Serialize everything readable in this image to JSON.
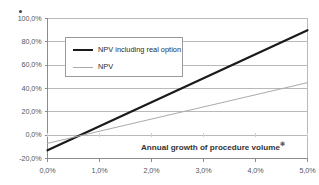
{
  "chart_data": {
    "type": "line",
    "title": "",
    "xlabel": "Annual growth of procedure volume",
    "xlabel_mark": "✻",
    "ylabel": "",
    "xlim": [
      0.0,
      5.0
    ],
    "ylim": [
      -20.0,
      100.0
    ],
    "grid": true,
    "legend_position": "upper-left-inside",
    "x_ticks": [
      "0,0%",
      "1,0%",
      "2,0%",
      "3,0%",
      "4,0%",
      "5,0%"
    ],
    "x_tick_values": [
      0.0,
      1.0,
      2.0,
      3.0,
      4.0,
      5.0
    ],
    "y_ticks": [
      "100,0%",
      "80,0%",
      "60,0%",
      "40,0%",
      "20,0%",
      "0,0%",
      "-20,0%"
    ],
    "y_tick_values": [
      100.0,
      80.0,
      60.0,
      40.0,
      20.0,
      0.0,
      -20.0
    ],
    "x": [
      0.0,
      5.0
    ],
    "series": [
      {
        "name": "NPV including real option",
        "color": "#1a1a1a",
        "width": 2.2,
        "values": [
          -13.0,
          90.0
        ]
      },
      {
        "name": "NPV",
        "color": "#aaaaaa",
        "width": 1.0,
        "values": [
          -7.0,
          45.0
        ]
      }
    ],
    "annotations": [
      {
        "name": "top-left-dot",
        "shape": "dot",
        "x_px": 19,
        "y_px": 10
      }
    ]
  },
  "legend": {
    "items": [
      {
        "label": "NPV including real option"
      },
      {
        "label": "NPV"
      }
    ]
  }
}
